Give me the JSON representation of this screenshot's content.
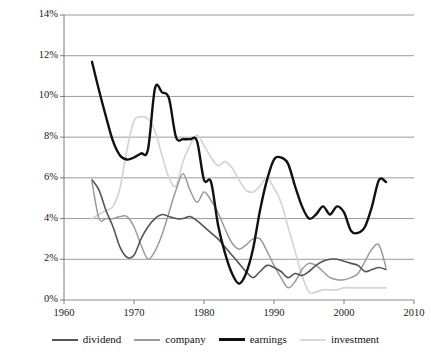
{
  "chart_data": {
    "type": "line",
    "title": "",
    "subtitle": "",
    "xlabel": "",
    "ylabel": "",
    "xlim": [
      1960,
      2010
    ],
    "ylim": [
      0,
      14
    ],
    "yunit": "%",
    "grid": true,
    "grid_axis": "y",
    "legend_position": "bottom",
    "xticks": [
      1960,
      1970,
      1980,
      1990,
      2000,
      2010
    ],
    "xticklabels": [
      "1960",
      "1970",
      "1980",
      "1990",
      "2000",
      "2010"
    ],
    "yticks": [
      0,
      2,
      4,
      6,
      8,
      10,
      12,
      14
    ],
    "yticklabels": [
      "0%",
      "2%",
      "4%",
      "6%",
      "8%",
      "10%",
      "12%",
      "14%"
    ],
    "x": [
      1964,
      1965,
      1966,
      1967,
      1968,
      1969,
      1970,
      1971,
      1972,
      1973,
      1974,
      1975,
      1976,
      1977,
      1978,
      1979,
      1980,
      1981,
      1982,
      1983,
      1984,
      1985,
      1986,
      1987,
      1988,
      1989,
      1990,
      1991,
      1992,
      1993,
      1994,
      1995,
      1996,
      1997,
      1998,
      1999,
      2000,
      2001,
      2002,
      2003,
      2004,
      2005,
      2006
    ],
    "series": [
      {
        "name": "dividend",
        "color": "#555555",
        "width": 1.6,
        "values": [
          5.9,
          5.4,
          4.4,
          3.6,
          2.6,
          2.1,
          2.2,
          3.0,
          3.6,
          4.0,
          4.2,
          4.1,
          4.0,
          4.0,
          4.1,
          3.9,
          3.6,
          3.3,
          3.0,
          2.6,
          2.2,
          1.8,
          1.4,
          1.1,
          1.4,
          1.7,
          1.6,
          1.4,
          1.1,
          1.3,
          1.2,
          1.4,
          1.7,
          1.9,
          2.0,
          2.0,
          1.9,
          1.8,
          1.7,
          1.4,
          1.5,
          1.6,
          1.5
        ]
      },
      {
        "name": "company",
        "color": "#9a9a9a",
        "width": 1.5,
        "values": [
          5.8,
          4.0,
          4.0,
          4.0,
          4.1,
          4.1,
          3.6,
          2.7,
          2.0,
          2.4,
          3.2,
          4.3,
          5.4,
          6.2,
          5.4,
          4.8,
          5.3,
          4.9,
          4.3,
          3.5,
          2.8,
          2.5,
          2.7,
          3.0,
          3.0,
          2.4,
          1.7,
          1.1,
          0.6,
          0.9,
          1.5,
          1.8,
          1.7,
          1.4,
          1.1,
          1.0,
          1.0,
          1.1,
          1.3,
          1.9,
          2.5,
          2.7,
          1.6
        ]
      },
      {
        "name": "earnings",
        "color": "#111111",
        "width": 2.4,
        "values": [
          11.7,
          10.3,
          9.0,
          7.8,
          7.1,
          6.9,
          7.0,
          7.2,
          7.4,
          10.4,
          10.2,
          9.9,
          8.0,
          7.9,
          7.9,
          7.8,
          5.9,
          5.8,
          3.7,
          2.3,
          1.3,
          0.8,
          1.3,
          2.5,
          4.4,
          5.9,
          6.9,
          7.0,
          6.7,
          5.6,
          4.6,
          4.0,
          4.2,
          4.6,
          4.2,
          4.6,
          4.3,
          3.4,
          3.3,
          3.6,
          4.6,
          5.9,
          5.8
        ]
      },
      {
        "name": "investment",
        "color": "#d4d4d4",
        "width": 1.7,
        "values": [
          4.0,
          4.2,
          4.4,
          4.6,
          5.5,
          7.4,
          8.8,
          9.0,
          8.9,
          8.3,
          7.1,
          6.0,
          5.6,
          6.8,
          7.6,
          8.1,
          7.6,
          7.0,
          6.6,
          6.8,
          6.5,
          5.9,
          5.4,
          5.3,
          5.6,
          6.0,
          5.5,
          4.8,
          3.6,
          2.4,
          1.2,
          0.4,
          0.4,
          0.5,
          0.5,
          0.5,
          0.6,
          0.6,
          0.6,
          0.6,
          0.6,
          0.6,
          0.6
        ]
      }
    ],
    "series_notes": {
      "earnings_tail": "declines sharply from 1999 peak to about 2.5% at 2006",
      "earnings_end_value": 2.5,
      "earnings_1999_peak": 5.9
    }
  },
  "legend": {
    "items": [
      {
        "label": "dividend",
        "color": "#555555",
        "width": 2.2
      },
      {
        "label": "company",
        "color": "#9a9a9a",
        "width": 2.0
      },
      {
        "label": "earnings",
        "color": "#111111",
        "width": 3.2
      },
      {
        "label": "investment",
        "color": "#d9d9d9",
        "width": 2.0
      }
    ]
  },
  "style": {
    "grid_color": "#808080",
    "axis_color": "#6e6e6e",
    "background": "#ffffff",
    "text_color": "#1a1a1a"
  }
}
